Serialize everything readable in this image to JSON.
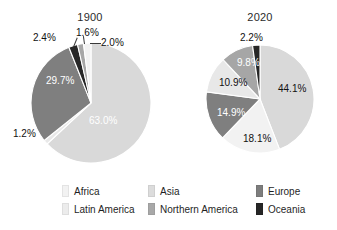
{
  "chart_data": {
    "type": "pie",
    "title": "",
    "legend_position": "bottom",
    "categories": [
      "Africa",
      "Asia",
      "Europe",
      "Latin America",
      "Northern America",
      "Oceania"
    ],
    "colors": {
      "Africa": "#f2f2f2",
      "Asia": "#d9d9d9",
      "Europe": "#7f7f7f",
      "Latin America": "#e8e8e8",
      "Northern America": "#a6a6a6",
      "Oceania": "#262626"
    },
    "charts": [
      {
        "title": "1900",
        "start_angle_deg": 0,
        "direction": "clockwise",
        "slices": [
          {
            "category": "Asia",
            "value": 63.0,
            "label": "63.0%",
            "label_style": "inside-light"
          },
          {
            "category": "Latin America",
            "value": 1.2,
            "label": "1.2%",
            "label_style": "outside"
          },
          {
            "category": "Europe",
            "value": 29.7,
            "label": "29.7%",
            "label_style": "inside-light"
          },
          {
            "category": "Oceania",
            "value": 2.4,
            "label": "2.4%",
            "label_style": "outside"
          },
          {
            "category": "Northern America",
            "value": 1.6,
            "label": "1.6%",
            "label_style": "outside"
          },
          {
            "category": "Africa",
            "value": 2.0,
            "label": "2.0%",
            "label_style": "outside"
          }
        ]
      },
      {
        "title": "2020",
        "start_angle_deg": 0,
        "direction": "clockwise",
        "slices": [
          {
            "category": "Asia",
            "value": 44.1,
            "label": "44.1%",
            "label_style": "inside-dark"
          },
          {
            "category": "Africa",
            "value": 18.1,
            "label": "18.1%",
            "label_style": "inside-dark"
          },
          {
            "category": "Europe",
            "value": 14.9,
            "label": "14.9%",
            "label_style": "inside-light"
          },
          {
            "category": "Latin America",
            "value": 10.9,
            "label": "10.9%",
            "label_style": "inside-dark"
          },
          {
            "category": "Northern America",
            "value": 9.8,
            "label": "9.8%",
            "label_style": "inside-light"
          },
          {
            "category": "Oceania",
            "value": 2.2,
            "label": "2.2%",
            "label_style": "outside"
          }
        ]
      }
    ]
  },
  "titles": {
    "left": "1900",
    "right": "2020"
  },
  "labels_1900": {
    "asia": "63.0%",
    "latin_america": "1.2%",
    "europe": "29.7%",
    "oceania": "2.4%",
    "northern_america": "1.6%",
    "africa": "2.0%"
  },
  "labels_2020": {
    "asia": "44.1%",
    "africa": "18.1%",
    "europe": "14.9%",
    "latin_america": "10.9%",
    "northern_america": "9.8%",
    "oceania": "2.2%"
  },
  "legend": {
    "items": [
      {
        "label": "Africa",
        "color": "#f2f2f2"
      },
      {
        "label": "Asia",
        "color": "#dcdcdc"
      },
      {
        "label": "Europe",
        "color": "#7d7d7d"
      },
      {
        "label": "Latin America",
        "color": "#ececec"
      },
      {
        "label": "Northern America",
        "color": "#a8a8a8"
      },
      {
        "label": "Oceania",
        "color": "#262626"
      }
    ]
  }
}
